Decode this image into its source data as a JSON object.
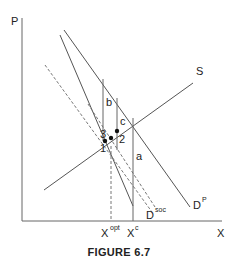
{
  "figure": {
    "caption": "FIGURE 6.7",
    "axes": {
      "y_label": "P",
      "x_label": "X"
    },
    "curves": {
      "supply": "S",
      "private_demand": {
        "base": "D",
        "sup": "P"
      },
      "social_demand": {
        "base": "D",
        "sup": "soc"
      }
    },
    "areas": {
      "a": "a",
      "b": "b",
      "c": "c"
    },
    "points": {
      "p1": "1",
      "p2": "2",
      "p3": "3"
    },
    "x_ticks": {
      "opt": {
        "base": "X",
        "sup": "opt"
      },
      "c": {
        "base": "X",
        "sup": "c"
      }
    },
    "colors": {
      "line": "#555555",
      "text": "#222222"
    }
  }
}
